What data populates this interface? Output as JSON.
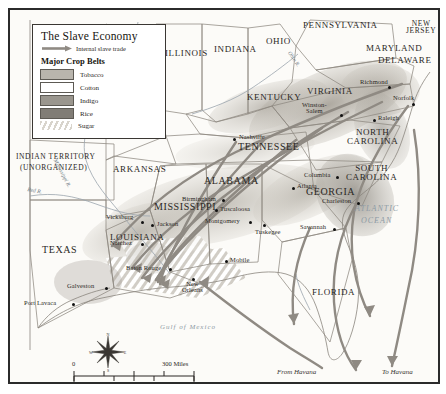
{
  "map": {
    "title": "The Slave Economy",
    "border_color": "#2b2b2b",
    "background_color": "#fbfaf7"
  },
  "legend": {
    "title": "The Slave Economy",
    "trade_label": "Internal slave trade",
    "trade_icon": "arrow-right-icon",
    "crops_heading": "Major Crop Belts",
    "items": [
      {
        "label": "Tobacco",
        "color": "#b9b5ad",
        "pattern": "solid"
      },
      {
        "label": "Cotton",
        "color": "#ffffff",
        "pattern": "solid"
      },
      {
        "label": "Indigo",
        "color": "#9a968e",
        "pattern": "solid"
      },
      {
        "label": "Rice",
        "color": "#817d76",
        "pattern": "solid"
      },
      {
        "label": "Sugar",
        "color": "#d8d4cc",
        "pattern": "diagonal-hatch"
      }
    ]
  },
  "states": [
    {
      "name": "ILLINOIS",
      "x": 163,
      "y": 44
    },
    {
      "name": "INDIANA",
      "x": 215,
      "y": 40
    },
    {
      "name": "OHIO",
      "x": 265,
      "y": 32
    },
    {
      "name": "PENNSYLVANIA",
      "x": 312,
      "y": 16
    },
    {
      "name": "NEW JERSEY",
      "x": 407,
      "y": 17
    },
    {
      "name": "MARYLAND",
      "x": 373,
      "y": 40
    },
    {
      "name": "DELAWARE",
      "x": 385,
      "y": 52
    },
    {
      "name": "VIRGINIA",
      "x": 313,
      "y": 82
    },
    {
      "name": "KENTUCKY",
      "x": 252,
      "y": 88
    },
    {
      "name": "TENNESSEE",
      "x": 243,
      "y": 137
    },
    {
      "name": "NORTH CAROLINA",
      "x": 353,
      "y": 128
    },
    {
      "name": "SOUTH CAROLINA",
      "x": 352,
      "y": 166
    },
    {
      "name": "GEORGIA",
      "x": 312,
      "y": 183
    },
    {
      "name": "ALABAMA",
      "x": 212,
      "y": 172
    },
    {
      "name": "MISSISSIPPI",
      "x": 160,
      "y": 198
    },
    {
      "name": "LOUISIANA",
      "x": 115,
      "y": 229
    },
    {
      "name": "ARKANSAS",
      "x": 118,
      "y": 160
    },
    {
      "name": "TEXAS",
      "x": 44,
      "y": 241
    },
    {
      "name": "FLORIDA",
      "x": 318,
      "y": 283
    },
    {
      "name": "INDIAN TERRITORY",
      "x": 10,
      "y": 148
    },
    {
      "name": "(UNORGANIZED)",
      "x": 13,
      "y": 159
    }
  ],
  "cities": [
    {
      "name": "Richmond",
      "x": 378,
      "y": 76,
      "dx": -30,
      "dy": -8
    },
    {
      "name": "Norfolk",
      "x": 402,
      "y": 93,
      "dx": -21,
      "dy": -9
    },
    {
      "name": "Winston-Salem",
      "x": 330,
      "y": 104,
      "dx": -39,
      "dy": -10
    },
    {
      "name": "Raleigh",
      "x": 363,
      "y": 109,
      "dx": 4,
      "dy": -4
    },
    {
      "name": "Columbia",
      "x": 326,
      "y": 166,
      "dx": -33,
      "dy": -4
    },
    {
      "name": "Charleston",
      "x": 347,
      "y": 192,
      "dx": -36,
      "dy": -4
    },
    {
      "name": "Savannah",
      "x": 323,
      "y": 218,
      "dx": -34,
      "dy": -4
    },
    {
      "name": "Atlanta",
      "x": 282,
      "y": 177,
      "dx": 4,
      "dy": -4
    },
    {
      "name": "Nashville",
      "x": 223,
      "y": 128,
      "dx": 5,
      "dy": -4
    },
    {
      "name": "Birmingham",
      "x": 212,
      "y": 189,
      "dx": -40,
      "dy": -4
    },
    {
      "name": "Tuscaloosa",
      "x": 205,
      "y": 199,
      "dx": 5,
      "dy": -4
    },
    {
      "name": "Montgomery",
      "x": 239,
      "y": 211,
      "dx": -44,
      "dy": -4
    },
    {
      "name": "Tuskegee",
      "x": 253,
      "y": 214,
      "dx": 0,
      "dy": 3
    },
    {
      "name": "Jackson",
      "x": 141,
      "y": 214,
      "dx": 5,
      "dy": -4
    },
    {
      "name": "Vicksburg",
      "x": 131,
      "y": 211,
      "dx": -35,
      "dy": -9
    },
    {
      "name": "Natchez",
      "x": 131,
      "y": 233,
      "dx": -30,
      "dy": -4
    },
    {
      "name": "Baton Rouge",
      "x": 159,
      "y": 258,
      "dx": -42,
      "dy": -4
    },
    {
      "name": "New Orleans",
      "x": 182,
      "y": 268,
      "dx": -8,
      "dy": 3
    },
    {
      "name": "Mobile",
      "x": 215,
      "y": 250,
      "dx": 5,
      "dy": -4
    },
    {
      "name": "Galveston",
      "x": 95,
      "y": 277,
      "dx": -37,
      "dy": -5
    },
    {
      "name": "Port Lavaca",
      "x": 62,
      "y": 293,
      "dx": -48,
      "dy": -4
    }
  ],
  "water_labels": [
    {
      "name": "ATLANTIC",
      "x": 355,
      "y": 201
    },
    {
      "name": "OCEAN",
      "x": 360,
      "y": 212
    },
    {
      "name": "Gulf of Mexico",
      "x": 165,
      "y": 320
    }
  ],
  "river_labels": [
    {
      "name": "Mississippi R.",
      "x": 58,
      "y": 168
    },
    {
      "name": "Ohio R.",
      "x": 295,
      "y": 48
    },
    {
      "name": "Red R.",
      "x": 22,
      "y": 188
    }
  ],
  "route_labels": [
    {
      "name": "From Havana",
      "x": 285,
      "y": 368
    },
    {
      "name": "To Havana",
      "x": 385,
      "y": 368
    }
  ],
  "scale": {
    "miles_zero": "0",
    "miles_max": "300 Miles",
    "km_zero": "0",
    "km_max": "300 Kilometers"
  },
  "compass": {
    "north": "N",
    "south": "S",
    "east": "E",
    "west": "W"
  }
}
